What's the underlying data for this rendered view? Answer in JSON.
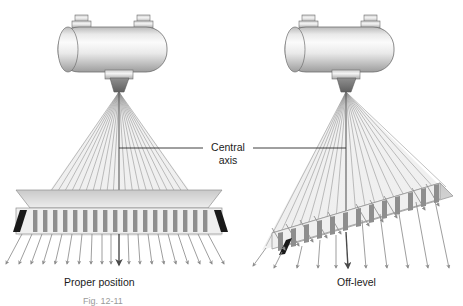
{
  "figure": {
    "background_color": "#ffffff",
    "ink_color": "#1b1b1b",
    "annotation": {
      "line1": "Central",
      "line2": "axis",
      "name": "central-axis-callout"
    },
    "caption_partial": "Fig. 12-11",
    "panels": [
      {
        "id": "left",
        "label": "Proper position",
        "state": "level",
        "tube": {
          "type": "x-ray-tube-housing",
          "body_fill_light": "#f2f2f2",
          "body_fill_dark": "#9a9a9a",
          "terminals": 2,
          "port": "collimator-port"
        },
        "collimator": {
          "type": "grid",
          "tilt_degrees": 0,
          "septa_count": 19,
          "top_fill": "#d8d8d8",
          "face_fill": "#efefef",
          "septa_fill": "#8e8e8e"
        },
        "beam": {
          "ray_count": 21,
          "arrow_count": 21,
          "central_ray_emphasis": true,
          "ray_color": "#8d8d8d"
        }
      },
      {
        "id": "right",
        "label": "Off-level",
        "state": "tilted",
        "tube": {
          "type": "x-ray-tube-housing",
          "body_fill_light": "#f2f2f2",
          "body_fill_dark": "#9a9a9a",
          "terminals": 2,
          "port": "collimator-port"
        },
        "collimator": {
          "type": "grid",
          "tilt_degrees": 22,
          "septa_count": 15,
          "top_fill": "#d8d8d8",
          "face_fill": "#efefef",
          "septa_fill": "#8e8e8e"
        },
        "beam": {
          "ray_count": 21,
          "arrow_count": 13,
          "central_ray_emphasis": true,
          "ray_color": "#8d8d8d"
        }
      }
    ]
  }
}
